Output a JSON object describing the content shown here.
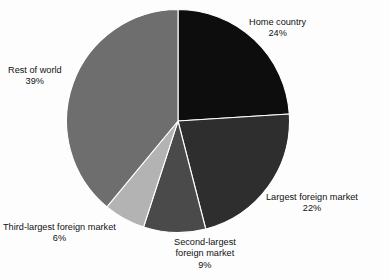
{
  "chart_data": {
    "type": "pie",
    "title": "",
    "subtitle": "",
    "xlabel": "",
    "ylabel": "",
    "legend_position": "none",
    "grid": false,
    "start_angle_deg": 0,
    "direction": "clockwise",
    "categories": [
      "Home country",
      "Largest foreign market",
      "Second-largest foreign market",
      "Third-largest foreign market",
      "Rest of world"
    ],
    "values": [
      24,
      22,
      9,
      6,
      39
    ],
    "value_unit": "%",
    "colors": [
      "#0d0d0d",
      "#2e2e2e",
      "#4a4a4a",
      "#b3b3b3",
      "#6e6e6e"
    ],
    "slices": [
      {
        "name": "Home country",
        "value": 24,
        "label": "Home country",
        "percent_text": "24%",
        "color": "#0d0d0d",
        "start_deg": 0,
        "end_deg": 86.4
      },
      {
        "name": "Largest foreign market",
        "value": 22,
        "label": "Largest foreign market",
        "percent_text": "22%",
        "color": "#2e2e2e",
        "start_deg": 86.4,
        "end_deg": 165.6
      },
      {
        "name": "Second-largest foreign market",
        "value": 9,
        "label_line1": "Second-largest",
        "label_line2": "foreign market",
        "percent_text": "9%",
        "color": "#4a4a4a",
        "start_deg": 165.6,
        "end_deg": 198.0
      },
      {
        "name": "Third-largest foreign market",
        "value": 6,
        "label": "Third-largest foreign market",
        "percent_text": "6%",
        "color": "#b3b3b3",
        "start_deg": 198.0,
        "end_deg": 219.6
      },
      {
        "name": "Rest of world",
        "value": 39,
        "label": "Rest of world",
        "percent_text": "39%",
        "color": "#6e6e6e",
        "start_deg": 219.6,
        "end_deg": 360.0
      }
    ],
    "separator_color": "#ffffff",
    "background_color": "#fdfdfd"
  }
}
